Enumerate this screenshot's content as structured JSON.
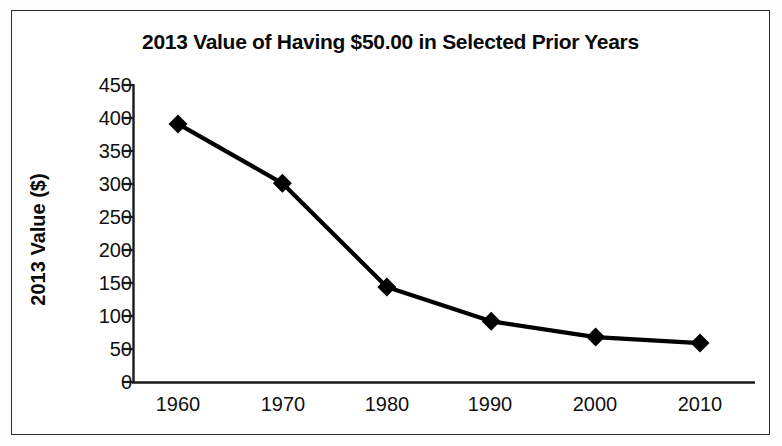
{
  "chart_data": {
    "type": "line",
    "title": "2013 Value of Having $50.00 in Selected Prior Years",
    "xlabel": "",
    "ylabel": "2013 Value ($)",
    "categories": [
      "1960",
      "1970",
      "1980",
      "1990",
      "2000",
      "2010"
    ],
    "x": [
      1960,
      1970,
      1980,
      1990,
      2000,
      2010
    ],
    "values": [
      391,
      301,
      144,
      92,
      68,
      59
    ],
    "series": [
      {
        "name": "2013 Value ($)",
        "values": [
          391,
          301,
          144,
          92,
          68,
          59
        ]
      }
    ],
    "ylim": [
      0,
      450
    ],
    "y_ticks": [
      0,
      50,
      100,
      150,
      200,
      250,
      300,
      350,
      400,
      450
    ],
    "y_tick_labels": [
      "0",
      "50",
      "100",
      "150",
      "200",
      "250",
      "300",
      "350",
      "400",
      "450"
    ],
    "x_tick_labels": [
      "1960",
      "1970",
      "1980",
      "1990",
      "2000",
      "2010"
    ],
    "grid": false,
    "legend": false,
    "legend_position": "none",
    "marker": "diamond",
    "line_color": "#000000",
    "marker_color": "#000000",
    "background_color": "#ffffff",
    "axis_color": "#1a1a1a",
    "annotations": []
  },
  "figure": {
    "border_color": "#2b2b2b"
  }
}
